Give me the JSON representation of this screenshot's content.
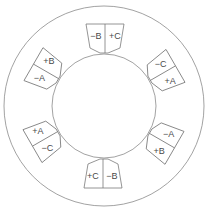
{
  "diagram": {
    "type": "stator-winding-slots",
    "center": [
      104,
      106
    ],
    "outer_radius": 100,
    "inner_radius": 52,
    "stroke_color": "#7a7a7a",
    "slots": [
      {
        "id": "top",
        "angle": 0,
        "left": "−B",
        "right": "+C"
      },
      {
        "id": "upper-right",
        "angle": 60,
        "left": "−C",
        "right": "+A"
      },
      {
        "id": "lower-right",
        "angle": 120,
        "left": "−A",
        "right": "+B"
      },
      {
        "id": "bottom",
        "angle": 180,
        "left": "−B",
        "right": "+C"
      },
      {
        "id": "lower-left",
        "angle": 240,
        "left": "−C",
        "right": "+A"
      },
      {
        "id": "upper-left",
        "angle": 300,
        "left": "−A",
        "right": "+B"
      }
    ]
  }
}
